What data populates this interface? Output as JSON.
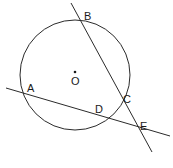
{
  "figure": {
    "type": "circle-geometry-diagram",
    "width": 173,
    "height": 168,
    "background_color": "#ffffff",
    "stroke_color": "#2b2b2b",
    "label_color": "#1a1a1a",
    "stroke_width": 1
  },
  "circle": {
    "center_x": 75,
    "center_y": 75,
    "radius": 55,
    "center_dot_x": 75,
    "center_dot_y": 72,
    "center_dot_radius": 1.3,
    "center_label": "O",
    "center_label_x": 71,
    "center_label_y": 76
  },
  "lines": [
    {
      "name": "secant-b-c-e",
      "x1": 71,
      "y1": 3,
      "x2": 152,
      "y2": 152,
      "passes_through": [
        "B",
        "C",
        "E"
      ]
    },
    {
      "name": "secant-a-d-e",
      "x1": 6,
      "y1": 88,
      "x2": 170,
      "y2": 136,
      "passes_through": [
        "A",
        "D",
        "E"
      ]
    }
  ],
  "points": [
    {
      "id": "A",
      "label": "A",
      "x": 24,
      "y": 93,
      "label_x": 27,
      "label_y": 83,
      "on_circle": true
    },
    {
      "id": "B",
      "label": "B",
      "x": 80,
      "y": 21,
      "label_x": 84,
      "label_y": 11,
      "on_circle": true
    },
    {
      "id": "C",
      "label": "C",
      "x": 120,
      "y": 101,
      "label_x": 123,
      "label_y": 94,
      "on_circle": true
    },
    {
      "id": "D",
      "label": "D",
      "x": 100,
      "y": 113,
      "label_x": 95,
      "label_y": 104,
      "on_circle": true
    },
    {
      "id": "E",
      "label": "E",
      "x": 137,
      "y": 131,
      "label_x": 140,
      "label_y": 121,
      "on_circle": false
    }
  ]
}
